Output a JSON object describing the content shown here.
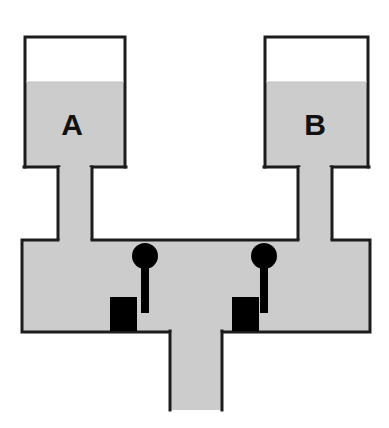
{
  "diagram": {
    "background_color": "#ffffff",
    "outline_color": "#1c1c1c",
    "liquid_color": "#cccccc",
    "valve_color": "#000000",
    "outline_width": 3
  },
  "vessels": [
    {
      "id": "vessel-a",
      "label": "A",
      "label_x": 72,
      "label_y": 127,
      "body": {
        "x": 25,
        "y": 37,
        "width": 100,
        "height": 130
      },
      "liquid_level_y": 82,
      "neck": {
        "x": 58,
        "y": 167,
        "width": 34,
        "height": 73
      }
    },
    {
      "id": "vessel-b",
      "label": "B",
      "label_x": 315,
      "label_y": 127,
      "body": {
        "x": 265,
        "y": 37,
        "width": 103,
        "height": 130
      },
      "liquid_level_y": 82,
      "neck": {
        "x": 298,
        "y": 167,
        "width": 34,
        "height": 73
      }
    }
  ],
  "chamber": {
    "id": "bottom-chamber",
    "x": 22,
    "y": 240,
    "width": 348,
    "height": 92,
    "filled": true
  },
  "outlet": {
    "id": "outlet-pipe",
    "x": 170,
    "y": 332,
    "width": 52,
    "height": 78,
    "filled": true
  },
  "valves": [
    {
      "id": "valve-left",
      "name": "left-valve",
      "ball": {
        "cx": 145,
        "cy": 256,
        "r": 13
      },
      "stem": {
        "x": 141,
        "y": 256,
        "width": 8,
        "height": 57
      },
      "block": {
        "x": 110,
        "y": 297,
        "width": 27,
        "height": 34
      }
    },
    {
      "id": "valve-right",
      "name": "right-valve",
      "ball": {
        "cx": 264,
        "cy": 256,
        "r": 13
      },
      "stem": {
        "x": 260,
        "y": 256,
        "width": 8,
        "height": 57
      },
      "block": {
        "x": 232,
        "y": 297,
        "width": 27,
        "height": 34
      }
    }
  ],
  "legend": {
    "liquid_label": "liquid (shaded)",
    "valve_label": "valve assembly"
  }
}
